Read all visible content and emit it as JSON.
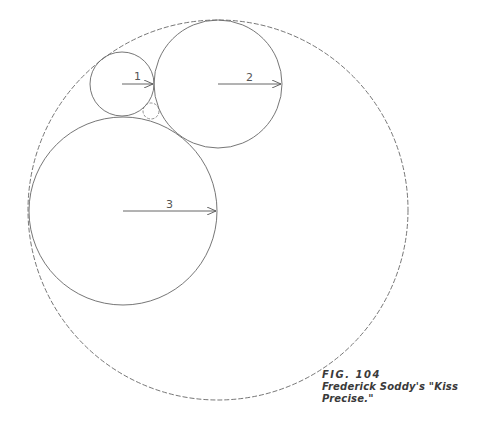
{
  "figure": {
    "number_label": "FIG. 104",
    "title": "Frederick Soddy's \"Kiss Precise.\""
  },
  "circles": {
    "outer": {
      "cx": 218,
      "cy": 210,
      "r": 190,
      "style": "dashed"
    },
    "c1": {
      "label": "1",
      "cx": 122,
      "cy": 84,
      "r": 32
    },
    "c2": {
      "label": "2",
      "cx": 218,
      "cy": 84,
      "r": 64
    },
    "c3": {
      "label": "3",
      "cx": 123,
      "cy": 211,
      "r": 94
    },
    "inner_small": {
      "cx": 151,
      "cy": 111,
      "r": 8,
      "style": "dashed"
    }
  },
  "colors": {
    "stroke": "#666666",
    "text": "#3a3a3a"
  }
}
